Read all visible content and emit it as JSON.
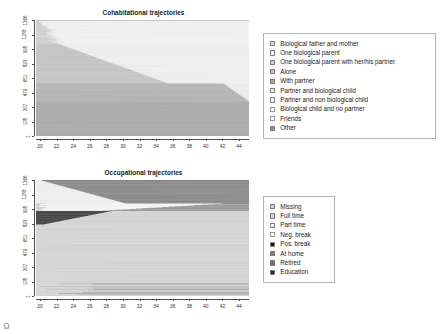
{
  "figure": {
    "background": "#ffffff",
    "width": 440,
    "height": 334
  },
  "panels": [
    {
      "id": "cohab",
      "title": "Cohabitational trajectories",
      "ylabel": "1503 seq. (n=1503), sorted",
      "xticks": [
        "20",
        "22",
        "24",
        "26",
        "28",
        "30",
        "32",
        "34",
        "36",
        "38",
        "40",
        "42",
        "44"
      ],
      "yticks": [
        "1",
        "135",
        "307",
        "479",
        "651",
        "823",
        "995",
        "1188",
        "1366"
      ]
    },
    {
      "id": "occup",
      "title": "Occupational trajectories",
      "ylabel": "1503 seq. (n=1503), sorted",
      "xticks": [
        "20",
        "22",
        "24",
        "26",
        "28",
        "30",
        "32",
        "34",
        "36",
        "38",
        "40",
        "42",
        "44"
      ],
      "yticks": [
        "1",
        "135",
        "307",
        "479",
        "651",
        "823",
        "995",
        "1188",
        "1366"
      ]
    }
  ],
  "legends": {
    "cohab": {
      "items": [
        {
          "label": "Biological father and mother",
          "color": "#d9d9d9"
        },
        {
          "label": "One biological parent",
          "color": "#f7f7f7"
        },
        {
          "label": "One biological parent with her/his partner",
          "color": "#cccccc"
        },
        {
          "label": "Alone",
          "color": "#bfbfbf"
        },
        {
          "label": "With partner",
          "color": "#a6a6a6"
        },
        {
          "label": "Partner and biological child",
          "color": "#ebebeb"
        },
        {
          "label": "Partner and non biological child",
          "color": "#f2f2f2"
        },
        {
          "label": "Biological child and no partner",
          "color": "#fafafa"
        },
        {
          "label": "Friends",
          "color": "#ffffff"
        },
        {
          "label": "Other",
          "color": "#8c8c8c"
        }
      ]
    },
    "occup": {
      "items": [
        {
          "label": "Missing",
          "color": "#d4d4d4"
        },
        {
          "label": "Full time",
          "color": "#cfcfcf"
        },
        {
          "label": "Part time",
          "color": "#f7f7f7"
        },
        {
          "label": "Neg. break",
          "color": "#fdfdfd"
        },
        {
          "label": "Pos. break",
          "color": "#1a1a1a"
        },
        {
          "label": "At home",
          "color": "#7a7a7a"
        },
        {
          "label": "Retired",
          "color": "#707070"
        },
        {
          "label": "Education",
          "color": "#262626"
        }
      ]
    }
  },
  "chart_data": [
    {
      "type": "area",
      "name": "cohab",
      "title": "Cohabitational trajectories",
      "xlabel": "",
      "ylabel": "1503 seq. (n=1503), sorted",
      "xlim": [
        19,
        45.5
      ],
      "ylim": [
        1,
        1503
      ],
      "grid": false,
      "legend_position": "right",
      "description": "Index plot of 1503 sorted cohabitation state sequences by age 19-45",
      "states": [
        {
          "label": "Biological father and mother",
          "color": "#d9d9d9"
        },
        {
          "label": "One biological parent",
          "color": "#f7f7f7"
        },
        {
          "label": "One biological parent with her/his partner",
          "color": "#cccccc"
        },
        {
          "label": "Alone",
          "color": "#bfbfbf"
        },
        {
          "label": "With partner",
          "color": "#a6a6a6"
        },
        {
          "label": "Partner and biological child",
          "color": "#ebebeb"
        },
        {
          "label": "Partner and non biological child",
          "color": "#f2f2f2"
        },
        {
          "label": "Biological child and no partner",
          "color": "#fafafa"
        },
        {
          "label": "Friends",
          "color": "#ffffff"
        },
        {
          "label": "Other",
          "color": "#8c8c8c"
        }
      ],
      "bands": [
        {
          "state": "Other",
          "y_frac_start": 0.0,
          "y_frac_end": 0.3,
          "x_end_frac": 1.0
        },
        {
          "state": "With partner",
          "y_frac_start": 0.3,
          "y_frac_end": 0.44,
          "x_end_frac": 0.94
        },
        {
          "state": "Alone",
          "y_frac_start": 0.44,
          "y_frac_end": 0.72,
          "x_end_frac": 0.45
        },
        {
          "state": "Biological father and mother",
          "y_frac_start": 0.72,
          "y_frac_end": 1.0,
          "x_end_frac": 0.12
        }
      ]
    },
    {
      "type": "area",
      "name": "occup",
      "title": "Occupational trajectories",
      "xlabel": "",
      "ylabel": "1503 seq. (n=1503), sorted",
      "xlim": [
        19,
        45.5
      ],
      "ylim": [
        1,
        1503
      ],
      "grid": false,
      "legend_position": "right",
      "description": "Index plot of 1503 sorted occupational state sequences by age 19-45",
      "states": [
        {
          "label": "Missing",
          "color": "#d4d4d4"
        },
        {
          "label": "Full time",
          "color": "#cfcfcf"
        },
        {
          "label": "Part time",
          "color": "#f7f7f7"
        },
        {
          "label": "Neg. break",
          "color": "#fdfdfd"
        },
        {
          "label": "Pos. break",
          "color": "#1a1a1a"
        },
        {
          "label": "At home",
          "color": "#7a7a7a"
        },
        {
          "label": "Retired",
          "color": "#707070"
        },
        {
          "label": "Education",
          "color": "#262626"
        }
      ],
      "bands": [
        {
          "state": "Full time",
          "y_frac_start": 0.0,
          "y_frac_end": 0.62,
          "x_end_frac": 1.0
        },
        {
          "state": "Education",
          "y_frac_start": 0.62,
          "y_frac_end": 0.72,
          "x_end_frac": 0.3
        },
        {
          "state": "Part time",
          "y_frac_start": 0.72,
          "y_frac_end": 0.86,
          "x_end_frac": 1.0
        },
        {
          "state": "At home",
          "y_frac_start": 0.86,
          "y_frac_end": 1.0,
          "x_end_frac": 1.0
        }
      ]
    }
  ]
}
